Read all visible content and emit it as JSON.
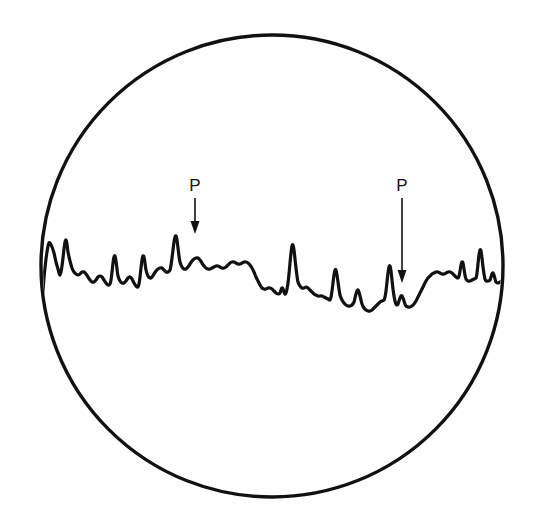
{
  "figure": {
    "kind": "ecg-rhythm-strip-in-circular-frame",
    "background_color": "#ffffff",
    "ink_color": "#111111",
    "frame": {
      "shape": "circle",
      "center_x": 272,
      "center_y": 266,
      "radius": 231,
      "stroke_width": 3.4,
      "stroke_color": "#111111",
      "fill": "none"
    },
    "annotations": [
      {
        "id": "p-wave-left",
        "label": "P",
        "label_x": 195,
        "label_y": 191,
        "arrow_x": 195,
        "arrow_top_y": 198,
        "arrow_tip_y": 234,
        "arrow_head_width": 9,
        "arrow_head_length": 13,
        "stroke_width": 1.6
      },
      {
        "id": "p-wave-right",
        "label": "P",
        "label_x": 402,
        "label_y": 191,
        "arrow_x": 402,
        "arrow_top_y": 198,
        "arrow_tip_y": 283,
        "arrow_head_width": 9,
        "arrow_head_length": 13,
        "stroke_width": 1.6
      }
    ]
  },
  "chart_data": {
    "type": "line",
    "title": "",
    "subtitle": "",
    "xlabel": "",
    "ylabel": "",
    "grid": false,
    "legend": null,
    "axis_visible": false,
    "xlim": [
      40,
      504
    ],
    "ylim": [
      310,
      225
    ],
    "note": "Single-lead electrocardiogram rhythm strip drawn inside a circular viewing field. y values are screen pixel coordinates (smaller y = taller deflection). Two arrows labelled P mark P waves.",
    "series": [
      {
        "name": "ecg-trace",
        "stroke_color": "#111111",
        "stroke_width": 3.2,
        "points": [
          [
            42,
            310
          ],
          [
            43,
            292
          ],
          [
            44,
            278
          ],
          [
            45,
            268
          ],
          [
            46,
            259
          ],
          [
            47,
            252
          ],
          [
            48,
            246
          ],
          [
            49,
            243
          ],
          [
            50,
            243
          ],
          [
            52,
            247
          ],
          [
            54,
            253
          ],
          [
            56,
            262
          ],
          [
            58,
            269
          ],
          [
            59,
            273
          ],
          [
            60,
            275
          ],
          [
            61,
            272
          ],
          [
            62,
            266
          ],
          [
            63,
            258
          ],
          [
            64,
            249
          ],
          [
            65,
            242
          ],
          [
            66,
            240
          ],
          [
            67,
            244
          ],
          [
            68,
            252
          ],
          [
            70,
            261
          ],
          [
            72,
            268
          ],
          [
            74,
            272
          ],
          [
            76,
            274
          ],
          [
            78,
            275
          ],
          [
            80,
            274
          ],
          [
            82,
            272
          ],
          [
            84,
            272
          ],
          [
            86,
            274
          ],
          [
            88,
            277
          ],
          [
            90,
            280
          ],
          [
            92,
            282
          ],
          [
            94,
            282
          ],
          [
            96,
            280
          ],
          [
            98,
            277
          ],
          [
            100,
            276
          ],
          [
            102,
            277
          ],
          [
            104,
            280
          ],
          [
            106,
            283
          ],
          [
            108,
            285
          ],
          [
            110,
            284
          ],
          [
            111,
            280
          ],
          [
            112,
            272
          ],
          [
            113,
            263
          ],
          [
            114,
            257
          ],
          [
            115,
            256
          ],
          [
            116,
            261
          ],
          [
            117,
            269
          ],
          [
            118,
            276
          ],
          [
            120,
            281
          ],
          [
            122,
            283
          ],
          [
            124,
            283
          ],
          [
            126,
            281
          ],
          [
            128,
            278
          ],
          [
            130,
            277
          ],
          [
            132,
            279
          ],
          [
            134,
            283
          ],
          [
            136,
            286
          ],
          [
            138,
            287
          ],
          [
            139,
            284
          ],
          [
            140,
            277
          ],
          [
            141,
            268
          ],
          [
            142,
            260
          ],
          [
            143,
            256
          ],
          [
            144,
            257
          ],
          [
            145,
            263
          ],
          [
            146,
            270
          ],
          [
            148,
            276
          ],
          [
            150,
            278
          ],
          [
            152,
            277
          ],
          [
            154,
            274
          ],
          [
            156,
            271
          ],
          [
            158,
            269
          ],
          [
            160,
            268
          ],
          [
            162,
            268
          ],
          [
            164,
            270
          ],
          [
            166,
            272
          ],
          [
            168,
            272
          ],
          [
            170,
            270
          ],
          [
            171,
            265
          ],
          [
            172,
            258
          ],
          [
            173,
            250
          ],
          [
            174,
            242
          ],
          [
            175,
            237
          ],
          [
            176,
            236
          ],
          [
            177,
            240
          ],
          [
            178,
            248
          ],
          [
            179,
            256
          ],
          [
            180,
            262
          ],
          [
            182,
            267
          ],
          [
            184,
            269
          ],
          [
            186,
            269
          ],
          [
            188,
            267
          ],
          [
            190,
            264
          ],
          [
            192,
            261
          ],
          [
            194,
            259
          ],
          [
            196,
            258
          ],
          [
            198,
            258
          ],
          [
            200,
            260
          ],
          [
            202,
            263
          ],
          [
            204,
            266
          ],
          [
            206,
            268
          ],
          [
            208,
            269
          ],
          [
            210,
            269
          ],
          [
            212,
            268
          ],
          [
            214,
            267
          ],
          [
            216,
            266
          ],
          [
            218,
            266
          ],
          [
            220,
            267
          ],
          [
            222,
            268
          ],
          [
            224,
            268
          ],
          [
            226,
            267
          ],
          [
            228,
            265
          ],
          [
            230,
            263
          ],
          [
            232,
            262
          ],
          [
            234,
            262
          ],
          [
            236,
            263
          ],
          [
            238,
            264
          ],
          [
            240,
            264
          ],
          [
            242,
            263
          ],
          [
            244,
            262
          ],
          [
            246,
            262
          ],
          [
            248,
            263
          ],
          [
            250,
            265
          ],
          [
            252,
            268
          ],
          [
            254,
            272
          ],
          [
            256,
            277
          ],
          [
            258,
            281
          ],
          [
            260,
            285
          ],
          [
            262,
            288
          ],
          [
            264,
            289
          ],
          [
            266,
            289
          ],
          [
            268,
            288
          ],
          [
            270,
            288
          ],
          [
            272,
            289
          ],
          [
            274,
            291
          ],
          [
            276,
            293
          ],
          [
            278,
            294
          ],
          [
            280,
            293
          ],
          [
            281,
            290
          ],
          [
            282,
            288
          ],
          [
            283,
            289
          ],
          [
            284,
            292
          ],
          [
            285,
            294
          ],
          [
            286,
            293
          ],
          [
            287,
            289
          ],
          [
            288,
            283
          ],
          [
            289,
            274
          ],
          [
            290,
            263
          ],
          [
            291,
            253
          ],
          [
            292,
            246
          ],
          [
            293,
            245
          ],
          [
            294,
            250
          ],
          [
            295,
            259
          ],
          [
            296,
            268
          ],
          [
            297,
            276
          ],
          [
            298,
            282
          ],
          [
            300,
            286
          ],
          [
            302,
            288
          ],
          [
            304,
            288
          ],
          [
            306,
            287
          ],
          [
            308,
            288
          ],
          [
            310,
            290
          ],
          [
            312,
            292
          ],
          [
            314,
            294
          ],
          [
            316,
            295
          ],
          [
            318,
            296
          ],
          [
            320,
            296
          ],
          [
            322,
            296
          ],
          [
            324,
            297
          ],
          [
            326,
            298
          ],
          [
            328,
            299
          ],
          [
            330,
            300
          ],
          [
            331,
            297
          ],
          [
            332,
            291
          ],
          [
            333,
            283
          ],
          [
            334,
            275
          ],
          [
            335,
            270
          ],
          [
            336,
            270
          ],
          [
            337,
            275
          ],
          [
            338,
            282
          ],
          [
            339,
            289
          ],
          [
            340,
            295
          ],
          [
            342,
            300
          ],
          [
            344,
            303
          ],
          [
            346,
            305
          ],
          [
            348,
            306
          ],
          [
            350,
            306
          ],
          [
            352,
            305
          ],
          [
            354,
            302
          ],
          [
            355,
            298
          ],
          [
            356,
            294
          ],
          [
            357,
            291
          ],
          [
            358,
            290
          ],
          [
            359,
            292
          ],
          [
            360,
            296
          ],
          [
            361,
            300
          ],
          [
            362,
            304
          ],
          [
            364,
            308
          ],
          [
            366,
            310
          ],
          [
            368,
            311
          ],
          [
            370,
            311
          ],
          [
            372,
            310
          ],
          [
            374,
            308
          ],
          [
            376,
            306
          ],
          [
            378,
            304
          ],
          [
            380,
            302
          ],
          [
            382,
            301
          ],
          [
            384,
            300
          ],
          [
            385,
            297
          ],
          [
            386,
            291
          ],
          [
            387,
            282
          ],
          [
            388,
            273
          ],
          [
            389,
            267
          ],
          [
            390,
            266
          ],
          [
            391,
            271
          ],
          [
            392,
            280
          ],
          [
            393,
            289
          ],
          [
            394,
            296
          ],
          [
            395,
            301
          ],
          [
            396,
            304
          ],
          [
            397,
            305
          ],
          [
            398,
            304
          ],
          [
            399,
            301
          ],
          [
            400,
            298
          ],
          [
            401,
            296
          ],
          [
            402,
            296
          ],
          [
            403,
            298
          ],
          [
            404,
            301
          ],
          [
            405,
            304
          ],
          [
            406,
            306
          ],
          [
            408,
            307
          ],
          [
            410,
            307
          ],
          [
            412,
            306
          ],
          [
            414,
            304
          ],
          [
            416,
            301
          ],
          [
            418,
            297
          ],
          [
            420,
            293
          ],
          [
            422,
            289
          ],
          [
            424,
            285
          ],
          [
            426,
            281
          ],
          [
            428,
            278
          ],
          [
            430,
            276
          ],
          [
            432,
            274
          ],
          [
            434,
            273
          ],
          [
            436,
            272
          ],
          [
            438,
            272
          ],
          [
            440,
            273
          ],
          [
            442,
            274
          ],
          [
            444,
            274
          ],
          [
            446,
            273
          ],
          [
            448,
            272
          ],
          [
            450,
            272
          ],
          [
            452,
            273
          ],
          [
            454,
            275
          ],
          [
            456,
            277
          ],
          [
            458,
            278
          ],
          [
            459,
            276
          ],
          [
            460,
            271
          ],
          [
            461,
            265
          ],
          [
            462,
            262
          ],
          [
            463,
            263
          ],
          [
            464,
            269
          ],
          [
            465,
            275
          ],
          [
            466,
            279
          ],
          [
            468,
            281
          ],
          [
            470,
            281
          ],
          [
            472,
            280
          ],
          [
            474,
            279
          ],
          [
            476,
            278
          ],
          [
            477,
            273
          ],
          [
            478,
            264
          ],
          [
            479,
            255
          ],
          [
            480,
            250
          ],
          [
            481,
            251
          ],
          [
            482,
            258
          ],
          [
            483,
            267
          ],
          [
            484,
            274
          ],
          [
            485,
            279
          ],
          [
            486,
            281
          ],
          [
            488,
            281
          ],
          [
            490,
            280
          ],
          [
            491,
            277
          ],
          [
            492,
            274
          ],
          [
            493,
            273
          ],
          [
            494,
            275
          ],
          [
            495,
            279
          ],
          [
            496,
            282
          ],
          [
            498,
            283
          ],
          [
            500,
            282
          ],
          [
            502,
            281
          ],
          [
            503,
            281
          ],
          [
            503,
            300
          ],
          [
            503,
            320
          ]
        ]
      }
    ],
    "annotated_features": [
      {
        "label": "P",
        "x": 195,
        "description": "P wave marked by left arrow"
      },
      {
        "label": "P",
        "x": 402,
        "description": "P wave marked by right arrow"
      }
    ]
  }
}
